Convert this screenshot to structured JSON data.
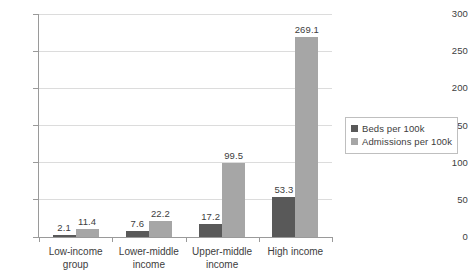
{
  "chart_data": {
    "type": "bar",
    "title": "",
    "subtitle": "",
    "xlabel": "",
    "ylabel": "",
    "ylim": [
      0,
      300
    ],
    "y_ticks": [
      0,
      50,
      100,
      150,
      200,
      250,
      300
    ],
    "grid": true,
    "legend_position": "right",
    "grouping": "grouped",
    "categories": [
      "Low-income\ngroup",
      "Lower-middle\nincome",
      "Upper-middle\nincome",
      "High income"
    ],
    "series": [
      {
        "name": "Beds per 100k",
        "color": "#595959",
        "values": [
          2.1,
          7.6,
          17.2,
          53.3
        ],
        "labels": [
          "2.1",
          "7.6",
          "17.2",
          "53.3"
        ]
      },
      {
        "name": "Admissions per 100k",
        "color": "#a6a6a6",
        "values": [
          11.4,
          22.2,
          99.5,
          269.1
        ],
        "labels": [
          "11.4",
          "22.2",
          "99.5",
          "269.1"
        ]
      }
    ]
  },
  "axis": {
    "y_tick_labels": [
      "300",
      "250",
      "200",
      "150",
      "100",
      "50",
      "0"
    ],
    "axis_line_color": "#9a9a9a",
    "gridline_color": "#dcdcdc"
  },
  "legend": {
    "entries": [
      {
        "label": "Beds per 100k",
        "color": "#595959"
      },
      {
        "label": "Admissions per 100k",
        "color": "#a6a6a6"
      }
    ]
  }
}
